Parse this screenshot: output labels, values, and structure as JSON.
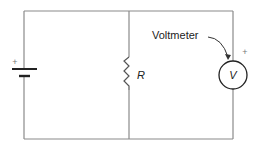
{
  "diagram": {
    "type": "circuit",
    "labels": {
      "battery_plus": "+",
      "resistor": "R",
      "voltmeter_symbol": "V",
      "voltmeter_plus": "+",
      "voltmeter_callout": "Voltmeter"
    },
    "components": [
      {
        "id": "battery",
        "kind": "battery",
        "polarity_label": "+"
      },
      {
        "id": "resistor",
        "kind": "resistor",
        "label": "R"
      },
      {
        "id": "voltmeter",
        "kind": "voltmeter",
        "label": "V",
        "polarity_label": "+",
        "callout": "Voltmeter"
      }
    ],
    "colors": {
      "wire": "#8a8a8a",
      "component": "#222222",
      "background": "#ffffff"
    }
  }
}
